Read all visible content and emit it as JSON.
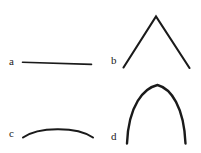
{
  "figure": {
    "background_color": "#ffffff",
    "stroke_color": "#1a1a1a",
    "width": 201,
    "height": 153,
    "panels": [
      {
        "label": "a",
        "shape_name": "straight-line",
        "description": "nearly horizontal straight line, very slight downward slope to the right",
        "stroke_width": 1.6,
        "path": "M 22.5 62.2 L 91.5 64.4"
      },
      {
        "label": "b",
        "shape_name": "sharp-peak",
        "description": "symmetric inverted-V with a sharp pointed apex",
        "stroke_width": 2.1,
        "path": "M 123.5 67.5 L 156.0 16.5 L 189.5 68.0"
      },
      {
        "label": "c",
        "shape_name": "shallow-arc",
        "description": "wide shallow convex arc, low curvature",
        "stroke_width": 2.1,
        "path": "M 23.0 137.5 C 38.0 127.0 76.0 126.0 93.0 137.5"
      },
      {
        "label": "d",
        "shape_name": "tall-arch",
        "description": "tall steep arch with a slightly pointed apex and near vertical legs",
        "stroke_width": 2.4,
        "path": "M 127.0 143.5 C 128.5 105.0 144.0 88.0 157.5 85.0 C 171.0 88.5 184.0 107.0 185.5 143.5"
      }
    ]
  }
}
